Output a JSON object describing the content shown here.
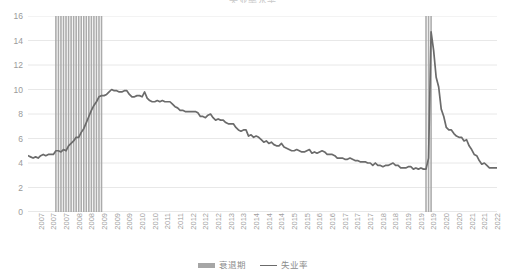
{
  "chart_title": "失业率水平",
  "legend": {
    "position": "bottom-center",
    "items": [
      {
        "label": "衰退期",
        "type": "bar",
        "color": "#a6a6a6"
      },
      {
        "label": "失业率",
        "type": "line",
        "color": "#6b6b6b"
      }
    ]
  },
  "axis": {
    "y_label": "",
    "x_label": "",
    "y_ticks": [
      "0",
      "2",
      "4",
      "6",
      "8",
      "10",
      "12",
      "14",
      "16"
    ],
    "x_ticks": [
      "2007",
      "2007",
      "2007",
      "2008",
      "2008",
      "2009",
      "2009",
      "2009",
      "2010",
      "2010",
      "2011",
      "2011",
      "2012",
      "2012",
      "2012",
      "2013",
      "2013",
      "2014",
      "2014",
      "2014",
      "2015",
      "2015",
      "2016",
      "2016",
      "2017",
      "2017",
      "2017",
      "2018",
      "2018",
      "2019",
      "2019",
      "2019",
      "2020",
      "2020",
      "2021",
      "2021",
      "2022"
    ]
  },
  "colors": {
    "line": "#6b6b6b",
    "recession_band": "#a6a6a6",
    "gridline": "#e8e8e8",
    "axis_text": "#9a9a9a",
    "background": "#ffffff"
  },
  "chart_data": {
    "type": "line",
    "title": "失业率水平",
    "xlabel": "",
    "ylabel": "",
    "ylim": [
      0,
      16
    ],
    "xlim": [
      "2007-01",
      "2022-06"
    ],
    "grid": true,
    "legend_position": "bottom",
    "series": [
      {
        "name": "失业率",
        "color": "#6b6b6b",
        "x": [
          "2007-01",
          "2007-02",
          "2007-03",
          "2007-04",
          "2007-05",
          "2007-06",
          "2007-07",
          "2007-08",
          "2007-09",
          "2007-10",
          "2007-11",
          "2007-12",
          "2008-01",
          "2008-02",
          "2008-03",
          "2008-04",
          "2008-05",
          "2008-06",
          "2008-07",
          "2008-08",
          "2008-09",
          "2008-10",
          "2008-11",
          "2008-12",
          "2009-01",
          "2009-02",
          "2009-03",
          "2009-04",
          "2009-05",
          "2009-06",
          "2009-07",
          "2009-08",
          "2009-09",
          "2009-10",
          "2009-11",
          "2009-12",
          "2010-01",
          "2010-02",
          "2010-03",
          "2010-04",
          "2010-05",
          "2010-06",
          "2010-07",
          "2010-08",
          "2010-09",
          "2010-10",
          "2010-11",
          "2010-12",
          "2011-01",
          "2011-02",
          "2011-03",
          "2011-04",
          "2011-05",
          "2011-06",
          "2011-07",
          "2011-08",
          "2011-09",
          "2011-10",
          "2011-11",
          "2011-12",
          "2012-01",
          "2012-02",
          "2012-03",
          "2012-04",
          "2012-05",
          "2012-06",
          "2012-07",
          "2012-08",
          "2012-09",
          "2012-10",
          "2012-11",
          "2012-12",
          "2013-01",
          "2013-02",
          "2013-03",
          "2013-04",
          "2013-05",
          "2013-06",
          "2013-07",
          "2013-08",
          "2013-09",
          "2013-10",
          "2013-11",
          "2013-12",
          "2014-01",
          "2014-02",
          "2014-03",
          "2014-04",
          "2014-05",
          "2014-06",
          "2014-07",
          "2014-08",
          "2014-09",
          "2014-10",
          "2014-11",
          "2014-12",
          "2015-01",
          "2015-02",
          "2015-03",
          "2015-04",
          "2015-05",
          "2015-06",
          "2015-07",
          "2015-08",
          "2015-09",
          "2015-10",
          "2015-11",
          "2015-12",
          "2016-01",
          "2016-02",
          "2016-03",
          "2016-04",
          "2016-05",
          "2016-06",
          "2016-07",
          "2016-08",
          "2016-09",
          "2016-10",
          "2016-11",
          "2016-12",
          "2017-01",
          "2017-02",
          "2017-03",
          "2017-04",
          "2017-05",
          "2017-06",
          "2017-07",
          "2017-08",
          "2017-09",
          "2017-10",
          "2017-11",
          "2017-12",
          "2018-01",
          "2018-02",
          "2018-03",
          "2018-04",
          "2018-05",
          "2018-06",
          "2018-07",
          "2018-08",
          "2018-09",
          "2018-10",
          "2018-11",
          "2018-12",
          "2019-01",
          "2019-02",
          "2019-03",
          "2019-04",
          "2019-05",
          "2019-06",
          "2019-07",
          "2019-08",
          "2019-09",
          "2019-10",
          "2019-11",
          "2019-12",
          "2020-01",
          "2020-02",
          "2020-03",
          "2020-04",
          "2020-05",
          "2020-06",
          "2020-07",
          "2020-08",
          "2020-09",
          "2020-10",
          "2020-11",
          "2020-12",
          "2021-01",
          "2021-02",
          "2021-03",
          "2021-04",
          "2021-05",
          "2021-06",
          "2021-07",
          "2021-08",
          "2021-09",
          "2021-10",
          "2021-11",
          "2021-12",
          "2022-01",
          "2022-02",
          "2022-03",
          "2022-04",
          "2022-05",
          "2022-06"
        ],
        "values": [
          4.6,
          4.5,
          4.4,
          4.5,
          4.4,
          4.6,
          4.7,
          4.6,
          4.7,
          4.7,
          4.7,
          5.0,
          5.0,
          4.9,
          5.1,
          5.0,
          5.4,
          5.6,
          5.8,
          6.1,
          6.1,
          6.5,
          6.8,
          7.3,
          7.8,
          8.3,
          8.7,
          9.0,
          9.4,
          9.5,
          9.5,
          9.6,
          9.8,
          10.0,
          9.9,
          9.9,
          9.8,
          9.8,
          9.9,
          9.9,
          9.6,
          9.4,
          9.4,
          9.5,
          9.5,
          9.4,
          9.8,
          9.3,
          9.1,
          9.0,
          9.0,
          9.1,
          9.0,
          9.1,
          9.0,
          9.0,
          9.0,
          8.8,
          8.6,
          8.5,
          8.3,
          8.3,
          8.2,
          8.2,
          8.2,
          8.2,
          8.2,
          8.1,
          7.8,
          7.8,
          7.7,
          7.9,
          8.0,
          7.7,
          7.5,
          7.6,
          7.5,
          7.5,
          7.3,
          7.2,
          7.2,
          7.2,
          6.9,
          6.7,
          6.6,
          6.7,
          6.7,
          6.2,
          6.3,
          6.1,
          6.2,
          6.1,
          5.9,
          5.7,
          5.8,
          5.6,
          5.7,
          5.5,
          5.4,
          5.4,
          5.6,
          5.3,
          5.2,
          5.1,
          5.0,
          5.0,
          5.1,
          5.0,
          4.9,
          4.9,
          5.0,
          5.1,
          4.8,
          4.9,
          4.8,
          4.9,
          5.0,
          4.9,
          4.7,
          4.7,
          4.7,
          4.6,
          4.4,
          4.4,
          4.4,
          4.3,
          4.3,
          4.4,
          4.3,
          4.2,
          4.2,
          4.1,
          4.1,
          4.1,
          4.0,
          4.0,
          3.8,
          4.0,
          3.8,
          3.8,
          3.7,
          3.8,
          3.8,
          3.9,
          4.0,
          3.8,
          3.8,
          3.6,
          3.6,
          3.6,
          3.7,
          3.7,
          3.5,
          3.6,
          3.5,
          3.6,
          3.5,
          3.5,
          4.4,
          14.7,
          13.2,
          11.0,
          10.2,
          8.4,
          7.8,
          6.9,
          6.7,
          6.7,
          6.4,
          6.2,
          6.1,
          6.1,
          5.8,
          5.9,
          5.4,
          5.1,
          4.7,
          4.6,
          4.2,
          3.9,
          4.0,
          3.8,
          3.6,
          3.6,
          3.6,
          3.6
        ]
      }
    ],
    "recessions": [
      {
        "name": "衰退期",
        "start": "2007-12",
        "end": "2009-06",
        "value": 16
      },
      {
        "name": "衰退期",
        "start": "2020-02",
        "end": "2020-04",
        "value": 16
      }
    ]
  }
}
